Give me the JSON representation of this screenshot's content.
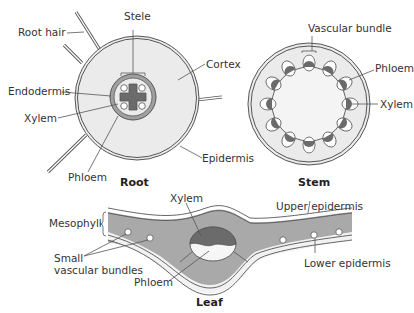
{
  "diagram": {
    "type": "biology-cross-sections",
    "colors": {
      "cortex_fill": "#ebebeb",
      "dark_tissue": "#6b6b6b",
      "mid_tissue": "#a9a9a9",
      "outline": "#555555",
      "light_fill": "#f6f6f6"
    },
    "root": {
      "title": "Root",
      "labels": {
        "root_hair": "Root hair",
        "stele": "Stele",
        "cortex": "Cortex",
        "endodermis": "Endodermis",
        "xylem": "Xylem",
        "phloem": "Phloem",
        "epidermis": "Epidermis"
      }
    },
    "stem": {
      "title": "Stem",
      "labels": {
        "vascular_bundle": "Vascular bundle",
        "phloem": "Phloem",
        "xylem": "Xylem"
      }
    },
    "leaf": {
      "title": "Leaf",
      "labels": {
        "mesophyll": "Mesophyll",
        "xylem": "Xylem",
        "upper_epidermis": "Upper epidermis",
        "small_vascular_bundles_1": "Small",
        "small_vascular_bundles_2": "vascular bundles",
        "phloem": "Phloem",
        "lower_epidermis": "Lower epidermis"
      }
    }
  }
}
